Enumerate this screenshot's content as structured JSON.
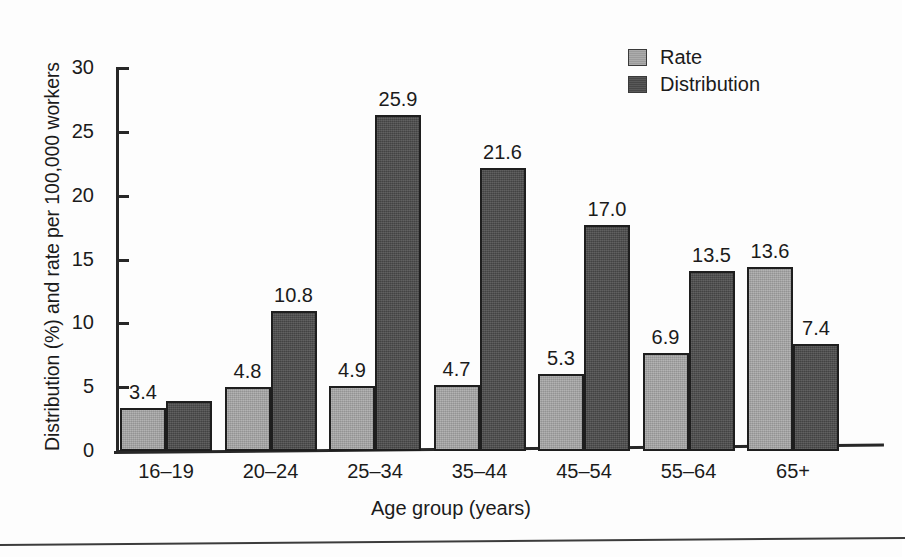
{
  "chart_data": {
    "type": "bar",
    "title": "",
    "xlabel": "Age group (years)",
    "ylabel": "Distribution (%) and rate per 100,000 workers",
    "categories": [
      "16–19",
      "20–24",
      "25–34",
      "35–44",
      "45–54",
      "55–64",
      "65+"
    ],
    "ylim": [
      0,
      30
    ],
    "yticks": [
      0,
      5,
      10,
      15,
      20,
      25,
      30
    ],
    "ytick_labels": [
      "0",
      "5",
      "10",
      "15",
      "20",
      "25",
      "30"
    ],
    "grid": false,
    "legend_position": "top-right",
    "series": [
      {
        "name": "Rate",
        "color": "#a3a3a3",
        "values": [
          3.4,
          4.8,
          4.9,
          4.7,
          5.3,
          6.9,
          13.6
        ],
        "labels": [
          "3.4",
          "4.8",
          "4.9",
          "4.7",
          "5.3",
          "6.9",
          "13.6"
        ],
        "drawn_heights": [
          3.4,
          5.0,
          5.1,
          5.2,
          6.0,
          7.7,
          14.4
        ]
      },
      {
        "name": "Distribution",
        "color": "#4c4c4c",
        "values": [
          3.8,
          10.8,
          25.9,
          21.6,
          17.0,
          13.5,
          7.4
        ],
        "labels": [
          "",
          "10.8",
          "25.9",
          "21.6",
          "17.0",
          "13.5",
          "7.4"
        ],
        "drawn_heights": [
          3.9,
          11.0,
          26.3,
          22.2,
          17.7,
          14.1,
          8.4
        ]
      }
    ]
  },
  "legend": {
    "items": [
      {
        "label": "Rate",
        "swatch": "rate"
      },
      {
        "label": "Distribution",
        "swatch": "dist"
      }
    ]
  }
}
